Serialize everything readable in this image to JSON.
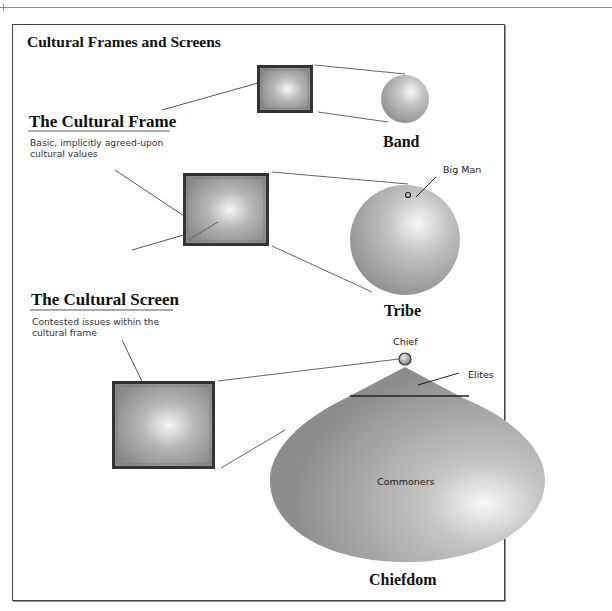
{
  "diagram": {
    "title": "Cultural Frames and Screens",
    "legend": {
      "frame": {
        "heading": "The Cultural Frame",
        "description_line1": "Basic, implicitly agreed-upon",
        "description_line2": "cultural values"
      },
      "screen": {
        "heading": "The Cultural Screen",
        "description_line1": "Contested issues within the",
        "description_line2": "cultural frame"
      }
    },
    "societies": [
      {
        "name": "Band",
        "shape": "small-sphere"
      },
      {
        "name": "Tribe",
        "shape": "large-sphere",
        "annotation": "Big Man"
      },
      {
        "name": "Chiefdom",
        "shape": "teardrop",
        "annotations": [
          "Chief",
          "Elites",
          "Commoners"
        ]
      }
    ],
    "labels": {
      "band": "Band",
      "tribe": "Tribe",
      "chiefdom": "Chiefdom",
      "big_man": "Big Man",
      "chief": "Chief",
      "elites": "Elites",
      "commoners": "Commoners"
    },
    "colors": {
      "shape_fill_dark": "#8a8a8a",
      "shape_fill_light": "#f2f2f2",
      "frame_border": "#333333",
      "connector": "#555555"
    }
  }
}
